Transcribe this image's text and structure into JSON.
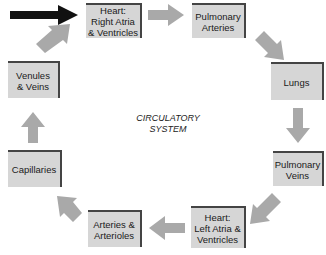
{
  "title": {
    "line1": "CIRCULATORY",
    "line2": "SYSTEM"
  },
  "nodes": {
    "heart_right": {
      "line1": "Heart:",
      "line2": "Right Atria",
      "line3": "& Ventricles"
    },
    "pulmonary_arteries": {
      "line1": "Pulmonary",
      "line2": "Arteries"
    },
    "lungs": {
      "line1": "Lungs"
    },
    "pulmonary_veins": {
      "line1": "Pulmonary",
      "line2": "Veins"
    },
    "heart_left": {
      "line1": "Heart:",
      "line2": "Left Atria &",
      "line3": "Ventricles"
    },
    "arteries": {
      "line1": "Arteries &",
      "line2": "Arterioles"
    },
    "capillaries": {
      "line1": "Capillaries"
    },
    "venules": {
      "line1": "Venules",
      "line2": "& Veins"
    }
  },
  "colors": {
    "box_fill": "#d6d6d6",
    "box_edge": "#444444",
    "arrow_gray": "#a9a9a9",
    "entry_arrow": "#111111"
  }
}
